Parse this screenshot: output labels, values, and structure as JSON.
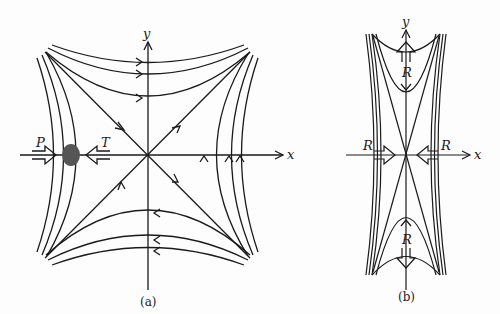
{
  "figure": {
    "panel_a": {
      "caption": "(a)",
      "x_axis_label": "x",
      "y_axis_label": "y",
      "arrow_labels": {
        "left": "P",
        "right": "T"
      },
      "description": "Hyperbolic stagnation-point flow: streamlines approach along diagonal toward origin and depart; a particle (dark blob) on the x-axis squeezed between arrows P and T"
    },
    "panel_b": {
      "caption": "(b)",
      "x_axis_label": "x",
      "y_axis_label": "y",
      "arrow_labels": {
        "left": "R",
        "right": "R",
        "top": "R",
        "bottom": "R"
      },
      "description": "Elongated stagnation-point flow compressed along x, stretched along y, with arrows labeled R"
    },
    "colors": {
      "line": "#1a1a1a",
      "blob": "#555555",
      "background": "#fdfdfd"
    }
  }
}
